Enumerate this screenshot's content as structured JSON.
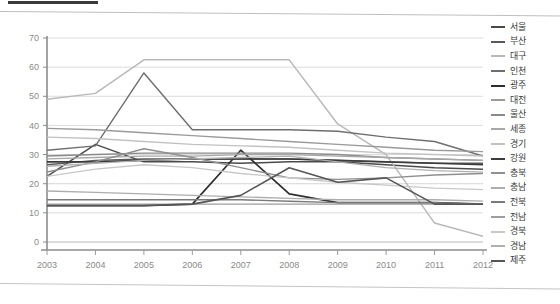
{
  "document_header": {
    "rule_present": true,
    "ghost_center_text": "",
    "ghost_right_text": ""
  },
  "legend": {
    "position": "right",
    "items": [
      {
        "label": "서울",
        "color": "#4a4a4a"
      },
      {
        "label": "부산",
        "color": "#5a5a5a"
      },
      {
        "label": "대구",
        "color": "#b9b9b9"
      },
      {
        "label": "인천",
        "color": "#6e6e6e"
      },
      {
        "label": "광주",
        "color": "#2e2e2e"
      },
      {
        "label": "대전",
        "color": "#9a9a9a"
      },
      {
        "label": "울산",
        "color": "#8a8a8a"
      },
      {
        "label": "세종",
        "color": "#a8a8a8"
      },
      {
        "label": "경기",
        "color": "#c2c2c2"
      },
      {
        "label": "강원",
        "color": "#3c3c3c"
      },
      {
        "label": "충북",
        "color": "#8f8f8f"
      },
      {
        "label": "충남",
        "color": "#adadad"
      },
      {
        "label": "전북",
        "color": "#7a7a7a"
      },
      {
        "label": "전남",
        "color": "#9e9e9e"
      },
      {
        "label": "경북",
        "color": "#c8c8c8"
      },
      {
        "label": "경남",
        "color": "#b0b0b0"
      },
      {
        "label": "제주",
        "color": "#555555"
      }
    ]
  },
  "chart_data": {
    "type": "line",
    "title": "",
    "subtitle": "",
    "xlabel": "",
    "ylabel": "",
    "x": [
      2003,
      2004,
      2005,
      2006,
      2007,
      2008,
      2009,
      2010,
      2011,
      2012
    ],
    "xtick_labels": [
      "2003",
      "2004",
      "2005",
      "2006",
      "2007",
      "2008",
      "2009",
      "2010",
      "2011",
      "2012"
    ],
    "ytick_labels": [
      "0",
      "10",
      "20",
      "30",
      "40",
      "50",
      "60",
      "70"
    ],
    "yticks": [
      0,
      10,
      20,
      30,
      40,
      50,
      60,
      70
    ],
    "ylim": [
      0,
      70
    ],
    "grid": true,
    "grid_axis": "y",
    "legend_position": "right",
    "series": [
      {
        "name": "서울",
        "color": "#4a4a4a",
        "width": 1.5,
        "values": [
          22.5,
          33.5,
          27.5,
          27.5,
          27.0,
          27.5,
          27.5,
          26.5,
          25.5,
          25.0
        ]
      },
      {
        "name": "부산",
        "color": "#5a5a5a",
        "width": 1.4,
        "values": [
          26.5,
          28.0,
          28.5,
          28.5,
          28.5,
          28.5,
          28.0,
          27.5,
          27.0,
          27.0
        ]
      },
      {
        "name": "대구",
        "color": "#b9b9b9",
        "width": 1.5,
        "values": [
          49.0,
          51.0,
          62.5,
          62.5,
          62.5,
          62.5,
          40.5,
          30.0,
          6.5,
          2.0
        ]
      },
      {
        "name": "인천",
        "color": "#6e6e6e",
        "width": 1.4,
        "values": [
          31.5,
          33.0,
          58.0,
          38.5,
          38.5,
          38.5,
          38.0,
          36.0,
          34.5,
          29.5
        ]
      },
      {
        "name": "광주",
        "color": "#2e2e2e",
        "width": 1.7,
        "values": [
          12.5,
          12.5,
          12.5,
          13.0,
          31.5,
          16.5,
          13.5,
          13.5,
          13.5,
          13.0
        ]
      },
      {
        "name": "대전",
        "color": "#9a9a9a",
        "width": 1.4,
        "values": [
          39.0,
          38.5,
          37.5,
          36.5,
          35.5,
          34.5,
          33.5,
          32.5,
          31.5,
          31.0
        ]
      },
      {
        "name": "울산",
        "color": "#8a8a8a",
        "width": 1.4,
        "values": [
          29.5,
          30.0,
          30.5,
          30.5,
          30.5,
          30.5,
          30.0,
          29.0,
          28.5,
          28.0
        ]
      },
      {
        "name": "세종",
        "color": "#a8a8a8",
        "width": 1.3,
        "values": [
          28.5,
          29.0,
          29.5,
          29.5,
          30.0,
          30.0,
          29.5,
          29.0,
          28.5,
          28.0
        ]
      },
      {
        "name": "경기",
        "color": "#c2c2c2",
        "width": 1.4,
        "values": [
          36.0,
          35.5,
          34.5,
          33.5,
          33.0,
          32.5,
          31.5,
          30.5,
          30.0,
          29.5
        ]
      },
      {
        "name": "강원",
        "color": "#3c3c3c",
        "width": 1.6,
        "values": [
          27.5,
          27.5,
          28.0,
          28.5,
          28.5,
          28.5,
          28.0,
          27.5,
          27.0,
          26.5
        ]
      },
      {
        "name": "충북",
        "color": "#8f8f8f",
        "width": 1.4,
        "values": [
          24.0,
          27.5,
          32.0,
          29.0,
          25.5,
          22.0,
          21.5,
          22.0,
          23.0,
          23.5
        ]
      },
      {
        "name": "충남",
        "color": "#adadad",
        "width": 1.3,
        "values": [
          17.5,
          17.0,
          16.5,
          16.0,
          15.5,
          15.0,
          14.5,
          14.5,
          14.5,
          14.0
        ]
      },
      {
        "name": "전북",
        "color": "#7a7a7a",
        "width": 1.4,
        "values": [
          14.5,
          14.5,
          14.5,
          14.5,
          14.5,
          14.0,
          13.5,
          13.5,
          13.5,
          13.0
        ]
      },
      {
        "name": "전남",
        "color": "#9e9e9e",
        "width": 1.3,
        "values": [
          13.0,
          13.0,
          13.0,
          13.0,
          13.0,
          13.0,
          13.0,
          13.0,
          13.0,
          13.0
        ]
      },
      {
        "name": "경북",
        "color": "#c8c8c8",
        "width": 1.3,
        "values": [
          22.5,
          25.0,
          26.5,
          25.5,
          23.5,
          22.0,
          20.5,
          19.5,
          18.5,
          18.0
        ]
      },
      {
        "name": "경남",
        "color": "#b0b0b0",
        "width": 1.3,
        "values": [
          26.0,
          27.0,
          28.0,
          28.5,
          29.0,
          29.5,
          27.5,
          25.5,
          24.5,
          24.0
        ]
      },
      {
        "name": "제주",
        "color": "#555555",
        "width": 1.6,
        "values": [
          12.5,
          12.5,
          12.5,
          13.0,
          16.0,
          25.5,
          20.5,
          22.0,
          13.0,
          13.0
        ]
      }
    ]
  }
}
